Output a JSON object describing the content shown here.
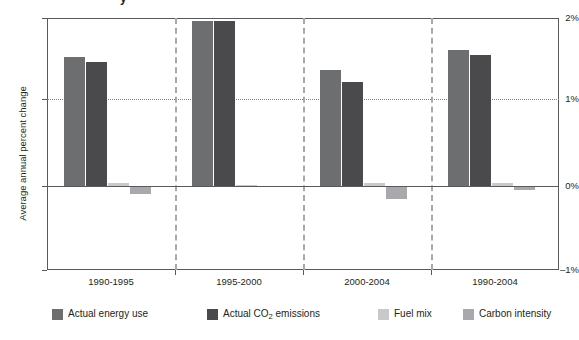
{
  "figure": {
    "title_partial": "y",
    "background": "#ffffff"
  },
  "chart_data": {
    "type": "bar",
    "title": "",
    "xlabel": "",
    "ylabel": "Average annual percent change",
    "categories": [
      "1990-1995",
      "1995-2000",
      "2000-2004",
      "1990-2004"
    ],
    "ylim": [
      -1,
      2
    ],
    "yticks": [
      2,
      1,
      0,
      -1
    ],
    "ytick_labels": [
      "2%",
      "1%",
      "0%",
      "–1%"
    ],
    "grid": "horizontal dotted at 1%, solid baseline at 0%",
    "legend_position": "bottom",
    "series": [
      {
        "name": "Actual energy use",
        "color": "#6d6e70",
        "values": [
          1.54,
          1.97,
          1.38,
          1.62
        ]
      },
      {
        "name": "Actual CO2 emissions",
        "color": "#4a4a4c",
        "values": [
          1.48,
          1.97,
          1.24,
          1.56
        ]
      },
      {
        "name": "Fuel mix",
        "color": "#c8c9cb",
        "values": [
          0.04,
          0.01,
          0.04,
          0.03
        ]
      },
      {
        "name": "Carbon intensity",
        "color": "#a7a9ac",
        "values": [
          -0.09,
          -0.01,
          -0.15,
          -0.05
        ]
      }
    ]
  },
  "yaxis": {
    "title": "Average annual percent change",
    "tick_2": "2%",
    "tick_1": "1%",
    "tick_0": "0%",
    "tick_neg1": "–1%"
  },
  "xaxis": {
    "labels": [
      "1990-1995",
      "1995-2000",
      "2000-2004",
      "1990-2004"
    ]
  },
  "legend": {
    "items": [
      {
        "label": "Actual energy use",
        "color": "#6d6e70"
      },
      {
        "label_before": "Actual CO",
        "label_sub": "2",
        "label_after": " emissions",
        "color": "#4a4a4c"
      },
      {
        "label": "Fuel mix",
        "color": "#c8c9cb"
      },
      {
        "label": "Carbon intensity",
        "color": "#a7a9ac"
      }
    ]
  }
}
